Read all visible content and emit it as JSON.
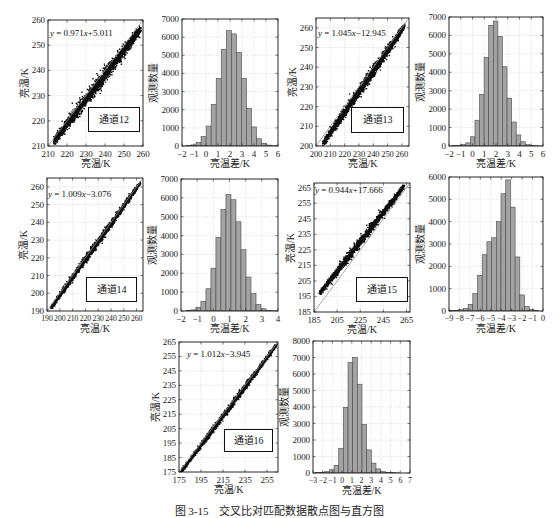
{
  "figure": {
    "caption": "图 3-15　交叉比对匹配数据散点图与直方图"
  },
  "chart_data": [
    {
      "type": "scatter",
      "channel": "通道12",
      "equation": "y = 0.971x+5.011",
      "slope": 0.971,
      "intercept": 5.011,
      "xlabel": "亮温/K",
      "ylabel": "亮温/K",
      "xlim": [
        210,
        260
      ],
      "ylim": [
        210,
        260
      ],
      "xticks": [
        210,
        220,
        230,
        240,
        250,
        260
      ],
      "yticks": [
        210,
        220,
        230,
        240,
        250,
        260
      ],
      "reference_line": "y = x",
      "point_x_range": [
        213,
        259
      ],
      "point_spread_k": 1.5,
      "grid": true
    },
    {
      "type": "bar",
      "kind": "histogram",
      "xlabel": "亮温差/K",
      "ylabel": "观测数量",
      "xlim": [
        -2,
        6
      ],
      "ylim": [
        0,
        7000
      ],
      "xticks": [
        -2,
        -1,
        0,
        1,
        2,
        3,
        4,
        5,
        6
      ],
      "yticks": [
        0,
        1000,
        2000,
        3000,
        4000,
        5000,
        6000,
        7000
      ],
      "bin_edges": [
        -1.67,
        -1.25,
        -0.83,
        -0.41,
        0.01,
        0.43,
        0.85,
        1.27,
        1.69,
        2.11,
        2.53,
        2.95,
        3.37,
        3.79,
        4.21,
        4.63,
        5.05,
        5.47,
        5.89
      ],
      "counts": [
        20,
        60,
        200,
        520,
        1100,
        2300,
        3730,
        5330,
        6360,
        6180,
        5150,
        3730,
        2080,
        1050,
        400,
        150,
        50,
        15
      ],
      "grid": true
    },
    {
      "type": "scatter",
      "channel": "通道13",
      "equation": "y = 1.045x−12.945",
      "slope": 1.045,
      "intercept": -12.945,
      "xlabel": "亮温/K",
      "ylabel": "亮温/K",
      "xlim": [
        200,
        265
      ],
      "ylim": [
        200,
        265
      ],
      "xticks": [
        200,
        210,
        220,
        230,
        240,
        250,
        260
      ],
      "yticks": [
        200,
        210,
        220,
        230,
        240,
        250,
        260
      ],
      "reference_line": "y = x",
      "point_x_range": [
        205,
        262
      ],
      "point_spread_k": 1.5,
      "grid": true
    },
    {
      "type": "bar",
      "kind": "histogram",
      "xlabel": "亮温差/K",
      "ylabel": "观测数量",
      "xlim": [
        -2,
        6
      ],
      "ylim": [
        0,
        7000
      ],
      "xticks": [
        -2,
        -1,
        0,
        1,
        2,
        3,
        4,
        5,
        6
      ],
      "yticks": [
        0,
        1000,
        2000,
        3000,
        4000,
        5000,
        6000,
        7000
      ],
      "bin_edges": [
        -1.74,
        -1.35,
        -0.96,
        -0.57,
        -0.18,
        0.21,
        0.6,
        0.99,
        1.38,
        1.77,
        2.16,
        2.55,
        2.94,
        3.33,
        3.72,
        4.11,
        4.5,
        4.89,
        5.28,
        5.67
      ],
      "counts": [
        20,
        40,
        80,
        170,
        500,
        1400,
        2800,
        4800,
        6550,
        6780,
        5950,
        4300,
        2600,
        1300,
        600,
        230,
        80,
        35,
        15
      ],
      "grid": true
    },
    {
      "type": "scatter",
      "channel": "通道14",
      "equation": "y = 1.009x−3.076",
      "slope": 1.009,
      "intercept": -3.076,
      "xlabel": "亮温/K",
      "ylabel": "亮温/K",
      "xlim": [
        190,
        265
      ],
      "ylim": [
        190,
        265
      ],
      "xticks": [
        190,
        200,
        210,
        220,
        230,
        240,
        250,
        260
      ],
      "yticks": [
        190,
        200,
        210,
        220,
        230,
        240,
        250,
        260
      ],
      "reference_line": "y = x",
      "point_x_range": [
        193,
        263
      ],
      "point_spread_k": 1.1,
      "grid": true
    },
    {
      "type": "bar",
      "kind": "histogram",
      "xlabel": "亮温差/K",
      "ylabel": "观测数量",
      "xlim": [
        -2,
        4
      ],
      "ylim": [
        0,
        7000
      ],
      "xticks": [
        -2,
        -1,
        0,
        1,
        2,
        3,
        4
      ],
      "yticks": [
        0,
        1000,
        2000,
        3000,
        4000,
        5000,
        6000,
        7000
      ],
      "bin_edges": [
        -1.7,
        -1.39,
        -1.08,
        -0.77,
        -0.46,
        -0.15,
        0.16,
        0.47,
        0.78,
        1.09,
        1.4,
        1.71,
        2.02,
        2.33,
        2.64,
        2.95,
        3.26,
        3.57,
        3.88
      ],
      "counts": [
        20,
        60,
        200,
        500,
        1180,
        2270,
        3900,
        5380,
        6180,
        5900,
        4730,
        3250,
        1800,
        920,
        340,
        120,
        40,
        15
      ],
      "grid": true
    },
    {
      "type": "scatter",
      "channel": "通道15",
      "equation": "y = 0.944x+17.666",
      "slope": 0.944,
      "intercept": 17.666,
      "xlabel": "亮温/K",
      "ylabel": "亮温/K",
      "xlim": [
        185,
        268
      ],
      "ylim": [
        185,
        268
      ],
      "xticks": [
        185,
        205,
        225,
        245,
        265
      ],
      "yticks": [
        185,
        195,
        205,
        215,
        225,
        235,
        245,
        255,
        265
      ],
      "reference_line": "y = x",
      "point_x_range": [
        190,
        263
      ],
      "point_spread_k": 1.5,
      "grid": true
    },
    {
      "type": "bar",
      "kind": "histogram",
      "xlabel": "亮温差/K",
      "ylabel": "观测数量",
      "xlim": [
        -9,
        0
      ],
      "ylim": [
        0,
        6000
      ],
      "xticks": [
        -9,
        -8,
        -7,
        -6,
        -5,
        -4,
        -3,
        -2,
        -1,
        0
      ],
      "yticks": [
        0,
        1000,
        2000,
        3000,
        4000,
        5000,
        6000
      ],
      "bin_edges": [
        -8.97,
        -8.52,
        -8.07,
        -7.62,
        -7.17,
        -6.72,
        -6.27,
        -5.82,
        -5.37,
        -4.92,
        -4.47,
        -4.02,
        -3.57,
        -3.12,
        -2.67,
        -2.22,
        -1.77,
        -1.32,
        -0.87,
        -0.42
      ],
      "counts": [
        15,
        30,
        60,
        120,
        300,
        780,
        1600,
        2520,
        3100,
        3280,
        4000,
        5250,
        5870,
        4650,
        2420,
        720,
        200,
        60,
        20
      ],
      "grid": true
    },
    {
      "type": "scatter",
      "channel": "通道16",
      "equation": "y = 1.012x−3.945",
      "slope": 1.012,
      "intercept": -3.945,
      "xlabel": "亮温/K",
      "ylabel": "亮温/K",
      "xlim": [
        175,
        265
      ],
      "ylim": [
        175,
        265
      ],
      "xticks": [
        175,
        195,
        215,
        235,
        255
      ],
      "yticks": [
        175,
        185,
        195,
        205,
        215,
        225,
        235,
        245,
        255,
        265
      ],
      "reference_line": "y = x",
      "point_x_range": [
        177,
        264
      ],
      "point_spread_k": 1.2,
      "grid": true
    },
    {
      "type": "bar",
      "kind": "histogram",
      "xlabel": "亮温差/K",
      "ylabel": "观测数量",
      "xlim": [
        -3,
        7
      ],
      "ylim": [
        0,
        8000
      ],
      "xticks": [
        -3,
        -2,
        -1,
        0,
        1,
        2,
        3,
        4,
        5,
        6,
        7
      ],
      "yticks": [
        0,
        1000,
        2000,
        3000,
        4000,
        5000,
        6000,
        7000,
        8000
      ],
      "bin_edges": [
        -2.75,
        -2.27,
        -1.79,
        -1.31,
        -0.83,
        -0.35,
        0.13,
        0.61,
        1.09,
        1.57,
        2.05,
        2.53,
        3.01,
        3.49,
        3.97,
        4.45,
        4.93,
        5.41,
        5.89
      ],
      "counts": [
        20,
        40,
        80,
        200,
        470,
        1500,
        3980,
        6700,
        7000,
        5380,
        2950,
        1400,
        600,
        250,
        80,
        40,
        20,
        10
      ],
      "grid": true
    }
  ]
}
